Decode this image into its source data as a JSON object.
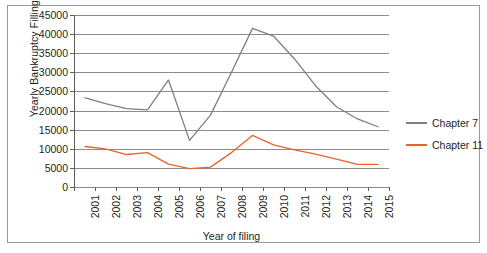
{
  "chart_data": {
    "type": "line",
    "title": "",
    "xlabel": "Year of filing",
    "ylabel": "Yearly Bankruptcy Fillings",
    "grid": true,
    "legend_position": "right",
    "ylim": [
      0,
      45000
    ],
    "ytick_step": 5000,
    "yticks": [
      "0",
      "5000",
      "10000",
      "15000",
      "20000",
      "25000",
      "30000",
      "35000",
      "40000",
      "45000"
    ],
    "categories": [
      "2001",
      "2002",
      "2003",
      "2004",
      "2005",
      "2006",
      "2007",
      "2008",
      "2009",
      "2010",
      "2011",
      "2012",
      "2013",
      "2014",
      "2015"
    ],
    "series": [
      {
        "name": "Chapter 7",
        "color": "#7f7f7f",
        "values": [
          23400,
          21800,
          20500,
          20200,
          28000,
          12200,
          18800,
          30000,
          41500,
          39500,
          33500,
          26500,
          21000,
          17800,
          15700
        ]
      },
      {
        "name": "Chapter 11",
        "color": "#e8622a",
        "values": [
          10600,
          10000,
          8500,
          9000,
          6000,
          4800,
          5200,
          9000,
          13500,
          11000,
          9700,
          8600,
          7300,
          5900,
          5900
        ]
      }
    ]
  },
  "legend": {
    "entries": [
      {
        "label": "Chapter 7",
        "color": "#7f7f7f"
      },
      {
        "label": "Chapter 11",
        "color": "#e8622a"
      }
    ]
  },
  "axes": {
    "y_title": "Yearly Bankruptcy Fillings",
    "x_title": "Year of filing"
  }
}
